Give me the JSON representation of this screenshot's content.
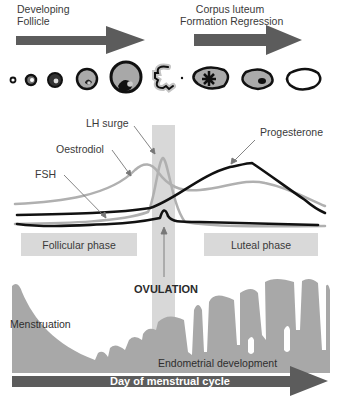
{
  "top": {
    "developing_follicle": [
      "Developing",
      "Follicle"
    ],
    "corpus_luteum": [
      "Corpus luteum",
      "Formation Regression"
    ]
  },
  "hormones": {
    "lh_surge": "LH surge",
    "oestrodiol": "Oestrodiol",
    "fsh": "FSH",
    "progesterone": "Progesterone"
  },
  "phases": {
    "follicular": "Follicular phase",
    "luteal": "Luteal phase"
  },
  "ovulation": "OVULATION",
  "endometrium": {
    "menstruation": "Menstruation",
    "development": "Endometrial development"
  },
  "axis": {
    "label": "Day of menstrual cycle"
  },
  "colors": {
    "arrow": "#5a5a5a",
    "light_curve": "#b0b0b0",
    "dark_curve": "#111111",
    "phase_box": "#d9d9d9",
    "endometrium": "#a8a8a8",
    "ovulation_band": "#d6d6d6"
  }
}
